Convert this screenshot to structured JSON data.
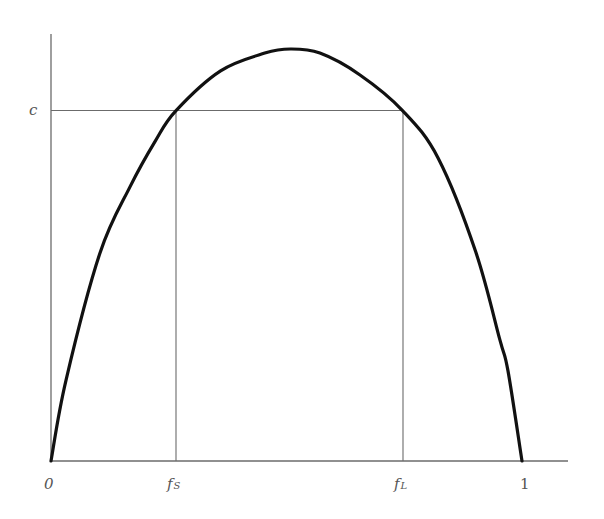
{
  "chart_data": {
    "type": "line",
    "title": "",
    "xlabel": "",
    "ylabel": "",
    "xlim": [
      0,
      1
    ],
    "grid": false,
    "legend": null,
    "x_tick_labels": [
      "0",
      "fS",
      "fL",
      "1"
    ],
    "y_tick_labels": [
      "c"
    ],
    "x_ticks": {
      "origin": "0",
      "fS": {
        "base": "f",
        "sub": "S",
        "value": 0.265
      },
      "fL": {
        "base": "f",
        "sub": "L",
        "value": 0.747
      },
      "one": "1"
    },
    "y_ticks": {
      "c": {
        "label": "c",
        "value": 0.85
      }
    },
    "series": [
      {
        "name": "curve",
        "x": [
          0,
          0.032,
          0.104,
          0.168,
          0.221,
          0.265,
          0.36,
          0.454,
          0.508,
          0.571,
          0.656,
          0.747,
          0.822,
          0.902,
          0.953,
          0.97,
          1.0
        ],
        "y": [
          0,
          0.197,
          0.505,
          0.666,
          0.776,
          0.85,
          0.947,
          0.99,
          1.0,
          0.99,
          0.937,
          0.85,
          0.735,
          0.507,
          0.294,
          0.22,
          0
        ]
      }
    ],
    "annotations": [
      "horizontal line at y=c from y-axis to x=fL",
      "vertical line at x=fS from x-axis to curve",
      "vertical line at x=fL from x-axis to curve"
    ]
  },
  "labels": {
    "c": "c",
    "zero": "0",
    "one": "1",
    "fs_base": "f",
    "fs_sub": "S",
    "fl_base": "f",
    "fl_sub": "L"
  }
}
